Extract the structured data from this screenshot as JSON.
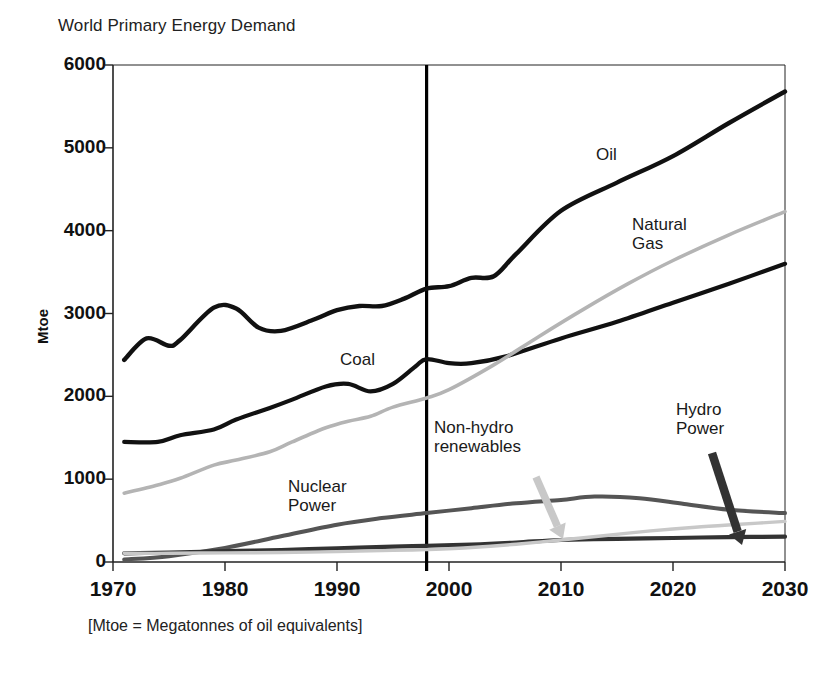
{
  "figure": {
    "title": "World Primary Energy Demand",
    "footnote": "[Mtoe = Megatonnes of oil equivalents]",
    "y_axis_title": "Mtoe"
  },
  "chart_data": {
    "type": "line",
    "title": "World Primary Energy Demand",
    "subtitle": "",
    "xlabel": "",
    "ylabel": "Mtoe",
    "footnote": "[Mtoe = Megatonnes of oil equivalents]",
    "xlim": [
      1970,
      2030
    ],
    "ylim": [
      0,
      6000
    ],
    "xticks": [
      1970,
      1980,
      1990,
      2000,
      2010,
      2020,
      2030
    ],
    "yticks": [
      0,
      1000,
      2000,
      3000,
      4000,
      5000,
      6000
    ],
    "grid": false,
    "legend": "none (inline series labels)",
    "annotations": [
      {
        "text": "Oil",
        "series": "Oil",
        "type": "inline-label"
      },
      {
        "text": "Natural Gas",
        "series": "Natural Gas",
        "type": "inline-label"
      },
      {
        "text": "Coal",
        "series": "Coal",
        "type": "inline-label"
      },
      {
        "text": "Nuclear Power",
        "series": "Nuclear Power",
        "type": "inline-label"
      },
      {
        "text": "Non-hydro renewables",
        "series": "Non-hydro renewables",
        "type": "arrow-label",
        "arrow_to_year": 2014
      },
      {
        "text": "Hydro Power",
        "series": "Hydro Power",
        "type": "arrow-label",
        "arrow_to_year": 2025
      }
    ],
    "vertical_divider": {
      "x": 1998,
      "label": "",
      "note": "history / projection split"
    },
    "series": [
      {
        "name": "Oil",
        "color": "#111111",
        "x": [
          1971,
          1973,
          1975,
          1976,
          1979,
          1981,
          1983,
          1985,
          1988,
          1990,
          1992,
          1994,
          1996,
          1998,
          2000,
          2002,
          2004,
          2006,
          2010,
          2015,
          2020,
          2025,
          2030
        ],
        "values": [
          2440,
          2700,
          2610,
          2680,
          3070,
          3060,
          2830,
          2790,
          2930,
          3040,
          3090,
          3090,
          3180,
          3300,
          3330,
          3430,
          3450,
          3720,
          4240,
          4580,
          4900,
          5300,
          5680
        ]
      },
      {
        "name": "Coal",
        "color": "#111111",
        "x": [
          1971,
          1974,
          1976,
          1979,
          1981,
          1984,
          1986,
          1989,
          1991,
          1993,
          1995,
          1997,
          1998,
          2000,
          2002,
          2005,
          2010,
          2015,
          2020,
          2025,
          2030
        ],
        "values": [
          1450,
          1450,
          1530,
          1600,
          1720,
          1860,
          1960,
          2120,
          2150,
          2060,
          2150,
          2360,
          2450,
          2400,
          2400,
          2480,
          2700,
          2900,
          3130,
          3360,
          3600
        ]
      },
      {
        "name": "Natural Gas",
        "color": "#b4b4b4",
        "x": [
          1971,
          1974,
          1976,
          1979,
          1981,
          1984,
          1986,
          1989,
          1991,
          1993,
          1995,
          1998,
          2000,
          2004,
          2008,
          2012,
          2016,
          2020,
          2025,
          2030
        ],
        "values": [
          830,
          930,
          1010,
          1170,
          1230,
          1330,
          1450,
          1620,
          1700,
          1760,
          1870,
          1980,
          2080,
          2380,
          2720,
          3050,
          3360,
          3640,
          3950,
          4230
        ]
      },
      {
        "name": "Nuclear Power",
        "color": "#555555",
        "x": [
          1971,
          1975,
          1980,
          1985,
          1990,
          1994,
          1998,
          2002,
          2006,
          2010,
          2013,
          2017,
          2021,
          2025,
          2030
        ],
        "values": [
          30,
          70,
          170,
          310,
          450,
          530,
          590,
          650,
          710,
          750,
          790,
          770,
          700,
          630,
          590
        ]
      },
      {
        "name": "Hydro Power",
        "color": "#333333",
        "x": [
          1971,
          1975,
          1980,
          1985,
          1990,
          1995,
          1998,
          2002,
          2006,
          2010,
          2015,
          2020,
          2025,
          2030
        ],
        "values": [
          105,
          115,
          130,
          145,
          165,
          185,
          195,
          210,
          235,
          265,
          280,
          290,
          300,
          305
        ]
      },
      {
        "name": "Non-hydro renewables",
        "color": "#c8c8c8",
        "x": [
          1971,
          1975,
          1980,
          1985,
          1990,
          1995,
          1998,
          2002,
          2006,
          2010,
          2014,
          2018,
          2022,
          2026,
          2030
        ],
        "values": [
          105,
          105,
          110,
          115,
          125,
          140,
          150,
          175,
          215,
          265,
          320,
          375,
          420,
          455,
          490
        ]
      }
    ]
  },
  "axis": {
    "y_ticks": [
      {
        "label": "6000",
        "value": 6000
      },
      {
        "label": "5000",
        "value": 5000
      },
      {
        "label": "4000",
        "value": 4000
      },
      {
        "label": "3000",
        "value": 3000
      },
      {
        "label": "2000",
        "value": 2000
      },
      {
        "label": "1000",
        "value": 1000
      },
      {
        "label": "0",
        "value": 0
      }
    ],
    "x_ticks": [
      {
        "label": "1970",
        "value": 1970
      },
      {
        "label": "1980",
        "value": 1980
      },
      {
        "label": "1990",
        "value": 1990
      },
      {
        "label": "2000",
        "value": 2000
      },
      {
        "label": "2010",
        "value": 2010
      },
      {
        "label": "2020",
        "value": 2020
      },
      {
        "label": "2030",
        "value": 2030
      }
    ]
  },
  "labels": {
    "oil": "Oil",
    "natural_gas": "Natural\nGas",
    "coal": "Coal",
    "nuclear_power": "Nuclear\nPower",
    "non_hydro_renewables": "Non-hydro\nrenewables",
    "hydro_power": "Hydro\nPower"
  },
  "colors": {
    "oil": "#111111",
    "coal": "#111111",
    "natural_gas": "#b4b4b4",
    "nuclear_power": "#555555",
    "hydro_power": "#333333",
    "non_hydro_renewables": "#c8c8c8",
    "axis": "#222222",
    "divider": "#000000",
    "background": "#ffffff"
  }
}
